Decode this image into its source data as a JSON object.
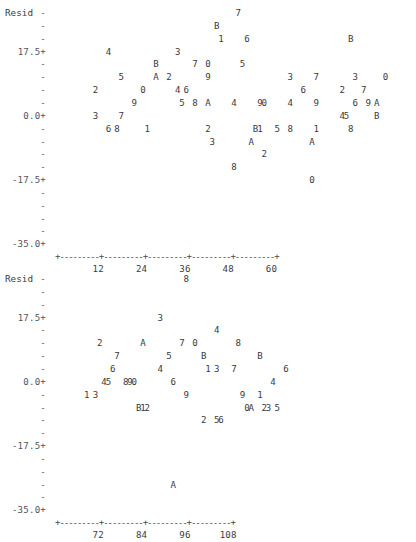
{
  "meta": {
    "plot_style": "minitab-character-plot",
    "panel_count": 2
  },
  "chart_data": [
    {
      "type": "scatter",
      "title": "",
      "ylabel": "Resid",
      "xlabel": "",
      "ylim": [
        -35.0,
        26.25
      ],
      "xlim": [
        0,
        62
      ],
      "grid": false,
      "legend": null,
      "y_ticks_labeled": [
        "17.5+",
        "0.0+",
        "-17.5+",
        "-35.0+"
      ],
      "y_ticks_minor": "-",
      "x_ticks": [
        12,
        24,
        36,
        48,
        60
      ],
      "axis_marker": "+",
      "axis_fill": "-",
      "point_glyphs": "digits 0-9 and letters A,B denote overplotted observation counts/ids",
      "rows": [
        {
          "y": "-",
          "text": "                                         7"
        },
        {
          "y": "-",
          "text": "                                    B"
        },
        {
          "y": "17.5+",
          "text": "                                     1     6                         B"
        },
        {
          "y": "-",
          "text": "           4               3"
        },
        {
          "y": "-",
          "text": "                      B        7  0        5"
        },
        {
          "y": "-",
          "text": "              5       A  2        9                  3     7        3        0"
        },
        {
          "y": "-",
          "text": "        2          0       4 6                          6        2     7"
        },
        {
          "y": "0.0+",
          "text": "                 9          5  8  A     4      90     4     9       6  9 A"
        },
        {
          "y": "-",
          "text": "        3     7                                                  45       B"
        },
        {
          "y": "-",
          "text": "           6 8      1             2          B1   5  8     1       8"
        },
        {
          "y": "-",
          "text": "                                   3        A              A"
        },
        {
          "y": "-",
          "text": "                                               2"
        },
        {
          "y": "-17.5+",
          "text": "                                        8"
        },
        {
          "y": "-",
          "text": "                                                          0"
        },
        {
          "y": "-",
          "text": ""
        },
        {
          "y": "-",
          "text": ""
        },
        {
          "y": "-",
          "text": ""
        },
        {
          "y": "-35.0+",
          "text": ""
        }
      ]
    },
    {
      "type": "scatter",
      "title": "",
      "ylabel": "Resid",
      "xlabel": "",
      "ylim": [
        -35.0,
        26.25
      ],
      "xlim": [
        62,
        112
      ],
      "grid": false,
      "legend": null,
      "y_ticks_labeled": [
        "17.5+",
        "0.0+",
        "-17.5+",
        "-35.0+"
      ],
      "y_ticks_minor": "-",
      "x_ticks": [
        72,
        84,
        96,
        108
      ],
      "axis_marker": "+",
      "axis_fill": "-",
      "point_glyphs": "digits 0-9 and letters A,B denote overplotted observation counts/ids",
      "rows": [
        {
          "y": "-",
          "text": "                        8"
        },
        {
          "y": "-",
          "text": ""
        },
        {
          "y": "-",
          "text": ""
        },
        {
          "y": "17.5+",
          "text": "                  3"
        },
        {
          "y": "-",
          "text": "                             4"
        },
        {
          "y": "-",
          "text": "      2         A       7  0        8"
        },
        {
          "y": "-",
          "text": "          7          5       B         B"
        },
        {
          "y": "-",
          "text": "         6         4       1 3   7           6"
        },
        {
          "y": "0.0+",
          "text": "      45   890       6                    4"
        },
        {
          "y": "-",
          "text": "   1 3                   9         9    1"
        },
        {
          "y": "-",
          "text": "            B12                  0A   23 5"
        },
        {
          "y": "-",
          "text": "                        2  56"
        },
        {
          "y": "-",
          "text": ""
        },
        {
          "y": "-17.5+",
          "text": ""
        },
        {
          "y": "-",
          "text": ""
        },
        {
          "y": "-",
          "text": ""
        },
        {
          "y": "-",
          "text": "            A"
        },
        {
          "y": "-",
          "text": ""
        },
        {
          "y": "-35.0+",
          "text": ""
        }
      ]
    }
  ],
  "panels": [
    {
      "id": "panel-1",
      "ylabel": "Resid",
      "y_axis": [
        {
          "label": "-",
          "labeled": false
        },
        {
          "label": "-",
          "labeled": false
        },
        {
          "label": "-",
          "labeled": false
        },
        {
          "label": "17.5+",
          "labeled": true
        },
        {
          "label": "-",
          "labeled": false
        },
        {
          "label": "-",
          "labeled": false
        },
        {
          "label": "-",
          "labeled": false
        },
        {
          "label": "-",
          "labeled": false
        },
        {
          "label": "0.0+",
          "labeled": true
        },
        {
          "label": "-",
          "labeled": false
        },
        {
          "label": "-",
          "labeled": false
        },
        {
          "label": "-",
          "labeled": false
        },
        {
          "label": "-",
          "labeled": false
        },
        {
          "label": "-17.5+",
          "labeled": true
        },
        {
          "label": "-",
          "labeled": false
        },
        {
          "label": "-",
          "labeled": false
        },
        {
          "label": "-",
          "labeled": false
        },
        {
          "label": "-",
          "labeled": false
        },
        {
          "label": "-35.0+",
          "labeled": true
        }
      ],
      "x_axis_line": "+---------+---------+---------+---------+---------+",
      "x_tick_labels": [
        "12",
        "24",
        "36",
        "48",
        "60"
      ],
      "points": [
        {
          "ch": "7",
          "col": 41,
          "row": 0
        },
        {
          "ch": "B",
          "col": 36,
          "row": 1
        },
        {
          "ch": "1",
          "col": 37,
          "row": 2
        },
        {
          "ch": "6",
          "col": 43,
          "row": 2
        },
        {
          "ch": "B",
          "col": 67,
          "row": 2
        },
        {
          "ch": "4",
          "col": 11,
          "row": 3
        },
        {
          "ch": "3",
          "col": 27,
          "row": 3
        },
        {
          "ch": "B",
          "col": 22,
          "row": 4
        },
        {
          "ch": "7",
          "col": 31,
          "row": 4
        },
        {
          "ch": "0",
          "col": 34,
          "row": 4
        },
        {
          "ch": "5",
          "col": 42,
          "row": 4
        },
        {
          "ch": "5",
          "col": 14,
          "row": 5
        },
        {
          "ch": "A",
          "col": 22,
          "row": 5
        },
        {
          "ch": "2",
          "col": 25,
          "row": 5
        },
        {
          "ch": "9",
          "col": 34,
          "row": 5
        },
        {
          "ch": "3",
          "col": 53,
          "row": 5
        },
        {
          "ch": "7",
          "col": 59,
          "row": 5
        },
        {
          "ch": "3",
          "col": 68,
          "row": 5
        },
        {
          "ch": "0",
          "col": 75,
          "row": 5
        },
        {
          "ch": "2",
          "col": 8,
          "row": 6
        },
        {
          "ch": "0",
          "col": 19,
          "row": 6
        },
        {
          "ch": "4",
          "col": 27,
          "row": 6
        },
        {
          "ch": "6",
          "col": 29,
          "row": 6
        },
        {
          "ch": "6",
          "col": 56,
          "row": 6
        },
        {
          "ch": "2",
          "col": 65,
          "row": 6
        },
        {
          "ch": "7",
          "col": 70,
          "row": 6
        },
        {
          "ch": "9",
          "col": 17,
          "row": 7
        },
        {
          "ch": "5",
          "col": 28,
          "row": 7
        },
        {
          "ch": "8",
          "col": 31,
          "row": 7
        },
        {
          "ch": "A",
          "col": 34,
          "row": 7
        },
        {
          "ch": "4",
          "col": 40,
          "row": 7
        },
        {
          "ch": "9",
          "col": 46,
          "row": 7
        },
        {
          "ch": "0",
          "col": 47,
          "row": 7
        },
        {
          "ch": "4",
          "col": 53,
          "row": 7
        },
        {
          "ch": "9",
          "col": 59,
          "row": 7
        },
        {
          "ch": "6",
          "col": 68,
          "row": 7
        },
        {
          "ch": "9",
          "col": 71,
          "row": 7
        },
        {
          "ch": "A",
          "col": 73,
          "row": 7
        },
        {
          "ch": "3",
          "col": 8,
          "row": 8
        },
        {
          "ch": "7",
          "col": 14,
          "row": 8
        },
        {
          "ch": "4",
          "col": 65,
          "row": 8
        },
        {
          "ch": "5",
          "col": 66,
          "row": 8
        },
        {
          "ch": "B",
          "col": 73,
          "row": 8
        },
        {
          "ch": "6",
          "col": 11,
          "row": 9
        },
        {
          "ch": "8",
          "col": 13,
          "row": 9
        },
        {
          "ch": "1",
          "col": 20,
          "row": 9
        },
        {
          "ch": "2",
          "col": 34,
          "row": 9
        },
        {
          "ch": "B",
          "col": 45,
          "row": 9
        },
        {
          "ch": "1",
          "col": 46,
          "row": 9
        },
        {
          "ch": "5",
          "col": 50,
          "row": 9
        },
        {
          "ch": "8",
          "col": 53,
          "row": 9
        },
        {
          "ch": "1",
          "col": 59,
          "row": 9
        },
        {
          "ch": "8",
          "col": 67,
          "row": 9
        },
        {
          "ch": "3",
          "col": 35,
          "row": 10
        },
        {
          "ch": "A",
          "col": 44,
          "row": 10
        },
        {
          "ch": "A",
          "col": 58,
          "row": 10
        },
        {
          "ch": "2",
          "col": 47,
          "row": 11
        },
        {
          "ch": "8",
          "col": 40,
          "row": 12
        },
        {
          "ch": "0",
          "col": 58,
          "row": 13
        }
      ]
    },
    {
      "id": "panel-2",
      "ylabel": "Resid",
      "y_axis": [
        {
          "label": "-",
          "labeled": false
        },
        {
          "label": "-",
          "labeled": false
        },
        {
          "label": "-",
          "labeled": false
        },
        {
          "label": "17.5+",
          "labeled": true
        },
        {
          "label": "-",
          "labeled": false
        },
        {
          "label": "-",
          "labeled": false
        },
        {
          "label": "-",
          "labeled": false
        },
        {
          "label": "-",
          "labeled": false
        },
        {
          "label": "0.0+",
          "labeled": true
        },
        {
          "label": "-",
          "labeled": false
        },
        {
          "label": "-",
          "labeled": false
        },
        {
          "label": "-",
          "labeled": false
        },
        {
          "label": "-",
          "labeled": false
        },
        {
          "label": "-17.5+",
          "labeled": true
        },
        {
          "label": "-",
          "labeled": false
        },
        {
          "label": "-",
          "labeled": false
        },
        {
          "label": "-",
          "labeled": false
        },
        {
          "label": "-",
          "labeled": false
        },
        {
          "label": "-35.0+",
          "labeled": true
        }
      ],
      "x_axis_line": "+---------+---------+---------+---------+",
      "x_tick_labels": [
        "72",
        "84",
        "96",
        "108"
      ],
      "points": [
        {
          "ch": "8",
          "col": 29,
          "row": 0
        },
        {
          "ch": "3",
          "col": 23,
          "row": 3
        },
        {
          "ch": "4",
          "col": 36,
          "row": 4
        },
        {
          "ch": "2",
          "col": 9,
          "row": 5
        },
        {
          "ch": "A",
          "col": 19,
          "row": 5
        },
        {
          "ch": "7",
          "col": 28,
          "row": 5
        },
        {
          "ch": "0",
          "col": 31,
          "row": 5
        },
        {
          "ch": "8",
          "col": 41,
          "row": 5
        },
        {
          "ch": "7",
          "col": 13,
          "row": 6
        },
        {
          "ch": "5",
          "col": 25,
          "row": 6
        },
        {
          "ch": "B",
          "col": 33,
          "row": 6
        },
        {
          "ch": "B",
          "col": 46,
          "row": 6
        },
        {
          "ch": "6",
          "col": 12,
          "row": 7
        },
        {
          "ch": "4",
          "col": 23,
          "row": 7
        },
        {
          "ch": "1",
          "col": 34,
          "row": 7
        },
        {
          "ch": "3",
          "col": 36,
          "row": 7
        },
        {
          "ch": "7",
          "col": 40,
          "row": 7
        },
        {
          "ch": "6",
          "col": 52,
          "row": 7
        },
        {
          "ch": "4",
          "col": 10,
          "row": 8
        },
        {
          "ch": "5",
          "col": 11,
          "row": 8
        },
        {
          "ch": "8",
          "col": 15,
          "row": 8
        },
        {
          "ch": "9",
          "col": 16,
          "row": 8
        },
        {
          "ch": "0",
          "col": 17,
          "row": 8
        },
        {
          "ch": "6",
          "col": 26,
          "row": 8
        },
        {
          "ch": "4",
          "col": 49,
          "row": 8
        },
        {
          "ch": "1",
          "col": 6,
          "row": 9
        },
        {
          "ch": "3",
          "col": 8,
          "row": 9
        },
        {
          "ch": "9",
          "col": 29,
          "row": 9
        },
        {
          "ch": "9",
          "col": 42,
          "row": 9
        },
        {
          "ch": "1",
          "col": 46,
          "row": 9
        },
        {
          "ch": "B",
          "col": 18,
          "row": 10
        },
        {
          "ch": "1",
          "col": 19,
          "row": 10
        },
        {
          "ch": "2",
          "col": 20,
          "row": 10
        },
        {
          "ch": "0",
          "col": 43,
          "row": 10
        },
        {
          "ch": "A",
          "col": 44,
          "row": 10
        },
        {
          "ch": "2",
          "col": 47,
          "row": 10
        },
        {
          "ch": "3",
          "col": 48,
          "row": 10
        },
        {
          "ch": "5",
          "col": 50,
          "row": 10
        },
        {
          "ch": "2",
          "col": 33,
          "row": 11
        },
        {
          "ch": "5",
          "col": 36,
          "row": 11
        },
        {
          "ch": "6",
          "col": 37,
          "row": 11
        },
        {
          "ch": "A",
          "col": 26,
          "row": 16
        }
      ]
    }
  ]
}
